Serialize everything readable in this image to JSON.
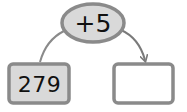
{
  "diagram": {
    "operator_bubble": {
      "label": "+5"
    },
    "start_box": {
      "value": "279"
    },
    "result_box": {
      "value": ""
    },
    "colors": {
      "stroke": "#8a8a8a",
      "fill_gray": "#d9d9d9",
      "fill_white": "#ffffff",
      "text": "#111111"
    }
  }
}
